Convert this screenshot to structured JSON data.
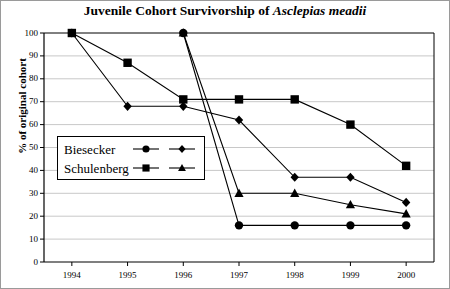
{
  "chart_data": {
    "type": "line",
    "title": "Juvenile Cohort Survivorship of Asclepias meadii",
    "title_plain": "Juvenile Cohort Survivorship of ",
    "title_italic": "Asclepias meadii",
    "xlabel": "",
    "ylabel": "% of original cohort",
    "categories": [
      "1994",
      "1995",
      "1996",
      "1997",
      "1998",
      "1999",
      "2000"
    ],
    "x": [
      1994,
      1995,
      1996,
      1997,
      1998,
      1999,
      2000
    ],
    "ylim": [
      0,
      100
    ],
    "xlim": [
      1993.5,
      2000.5
    ],
    "yticks": [
      0,
      10,
      20,
      30,
      40,
      50,
      60,
      70,
      80,
      90,
      100
    ],
    "ytick_labels": [
      "0",
      "10",
      "20",
      "30",
      "40",
      "50",
      "60",
      "70",
      "80",
      "90",
      "100"
    ],
    "grid": "horizontal",
    "legend_position": "inside-left",
    "series": [
      {
        "name": "Biesecker",
        "marker": "diamond",
        "start_year": 1994,
        "x": [
          1994,
          1995,
          1996,
          1997,
          1998,
          1999,
          2000
        ],
        "values": [
          100,
          68,
          68,
          62,
          37,
          37,
          26
        ]
      },
      {
        "name": "Biesecker",
        "marker": "circle",
        "start_year": 1996,
        "x": [
          1996,
          1997,
          1998,
          1999,
          2000
        ],
        "values": [
          100,
          16,
          16,
          16,
          16
        ]
      },
      {
        "name": "Schulenberg",
        "marker": "square",
        "start_year": 1994,
        "x": [
          1994,
          1995,
          1996,
          1997,
          1998,
          1999,
          2000
        ],
        "values": [
          100,
          87,
          71,
          71,
          71,
          60,
          42
        ]
      },
      {
        "name": "Schulenberg",
        "marker": "triangle",
        "start_year": 1996,
        "x": [
          1996,
          1997,
          1998,
          1999,
          2000
        ],
        "values": [
          100,
          30,
          30,
          25,
          21
        ]
      }
    ],
    "legend": [
      {
        "label": "Biesecker",
        "markers": [
          "circle",
          "diamond"
        ]
      },
      {
        "label": "Schulenberg",
        "markers": [
          "square",
          "triangle"
        ]
      }
    ],
    "colors": {
      "line": "#000000",
      "marker": "#000000",
      "grid": "#c8c8c8",
      "axis": "#000000",
      "background": "#ffffff",
      "border": "#9a9a9a"
    }
  }
}
